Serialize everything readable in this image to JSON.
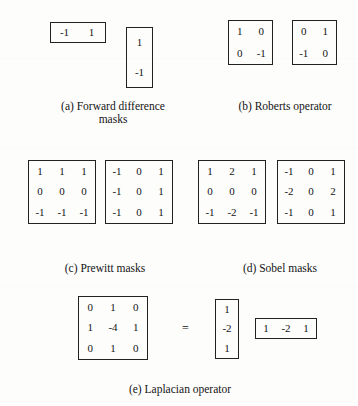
{
  "figure": {
    "background_color": "#fdfdfc",
    "ink_color": "#141414",
    "border_color": "#222222",
    "equals_symbol": "=",
    "groups": [
      {
        "id": "forward-difference",
        "caption": "(a) Forward difference\nmasks",
        "masks": [
          {
            "id": "forward-difference-horizontal",
            "rows": 1,
            "cols": 2,
            "values": [
              "-1",
              "1"
            ]
          },
          {
            "id": "forward-difference-vertical",
            "rows": 2,
            "cols": 1,
            "values": [
              "1",
              "-1"
            ]
          }
        ]
      },
      {
        "id": "roberts-operator",
        "caption": "(b) Roberts operator",
        "masks": [
          {
            "id": "roberts-mask-1",
            "rows": 2,
            "cols": 2,
            "values": [
              "1",
              "0",
              "0",
              "-1"
            ]
          },
          {
            "id": "roberts-mask-2",
            "rows": 2,
            "cols": 2,
            "values": [
              "0",
              "1",
              "-1",
              "0"
            ]
          }
        ]
      },
      {
        "id": "prewitt-masks",
        "caption": "(c) Prewitt masks",
        "masks": [
          {
            "id": "prewitt-horizontal",
            "rows": 3,
            "cols": 3,
            "values": [
              "1",
              "1",
              "1",
              "0",
              "0",
              "0",
              "-1",
              "-1",
              "-1"
            ]
          },
          {
            "id": "prewitt-vertical",
            "rows": 3,
            "cols": 3,
            "values": [
              "-1",
              "0",
              "1",
              "-1",
              "0",
              "1",
              "-1",
              "0",
              "1"
            ]
          }
        ]
      },
      {
        "id": "sobel-masks",
        "caption": "(d) Sobel masks",
        "masks": [
          {
            "id": "sobel-horizontal",
            "rows": 3,
            "cols": 3,
            "values": [
              "1",
              "2",
              "1",
              "0",
              "0",
              "0",
              "-1",
              "-2",
              "-1"
            ]
          },
          {
            "id": "sobel-vertical",
            "rows": 3,
            "cols": 3,
            "values": [
              "-1",
              "0",
              "1",
              "-2",
              "0",
              "2",
              "-1",
              "0",
              "1"
            ]
          }
        ]
      },
      {
        "id": "laplacian-operator",
        "caption": "(e) Laplacian operator",
        "masks": [
          {
            "id": "laplacian-kernel",
            "rows": 3,
            "cols": 3,
            "values": [
              "0",
              "1",
              "0",
              "1",
              "-4",
              "1",
              "0",
              "1",
              "0"
            ]
          },
          {
            "id": "laplacian-column-vector",
            "rows": 3,
            "cols": 1,
            "values": [
              "1",
              "-2",
              "1"
            ]
          },
          {
            "id": "laplacian-row-vector",
            "rows": 1,
            "cols": 3,
            "values": [
              "1",
              "-2",
              "1"
            ]
          }
        ]
      }
    ]
  }
}
